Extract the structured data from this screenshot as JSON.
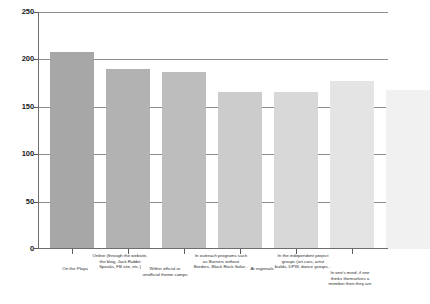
{
  "chart_data": {
    "type": "bar",
    "title": "",
    "subtitle": "",
    "xlabel": "",
    "ylabel": "",
    "ylim": [
      0,
      250
    ],
    "ytick_labels": [
      "0",
      "50",
      "100",
      "150",
      "200",
      "250"
    ],
    "ytick_values": [
      0,
      50,
      100,
      150,
      200,
      250
    ],
    "grid": true,
    "legend": "none",
    "categories": [
      "On the Playa",
      "Online (through the website, the blog, Jack Rabbit Speaks, FB site, etc.)",
      "Within official or unofficial theme camps",
      "In outreach programs such as Burners without Borders, Black Rock Solar...",
      "At regionals",
      "In the independent project groups (art cars, artist builds, DPW, dance groups...",
      "In one's mind, if one thinks themselves a member then they are"
    ],
    "values": [
      208,
      190,
      187,
      166,
      166,
      177,
      168
    ],
    "bar_colors": [
      "#a7a7a7",
      "#b2b2b2",
      "#bdbdbd",
      "#cccccc",
      "#d8d8d8",
      "#e4e4e4",
      "#f1f1f1"
    ]
  },
  "axis": {
    "y_ticks": [
      {
        "label": "250",
        "value": 250
      },
      {
        "label": "200",
        "value": 200
      },
      {
        "label": "150",
        "value": 150
      },
      {
        "label": "100",
        "value": 100
      },
      {
        "label": "50",
        "value": 50
      },
      {
        "label": "0",
        "value": 0
      }
    ]
  },
  "labels": {
    "cat0": "On the Playa",
    "cat1_l1": "Online (through the website,",
    "cat1_l2": "the blog, Jack Rabbit",
    "cat1_l3": "Speaks, FB site, etc.)",
    "cat2_l1": "Within official or",
    "cat2_l2": "unofficial theme camps",
    "cat3_l1": "In outreach programs such",
    "cat3_l2": "as Burners without",
    "cat3_l3": "Borders, Black Rock Solar...",
    "cat4": "At regionals",
    "cat5_l1": "In the independent project",
    "cat5_l2": "groups (art cars, artist",
    "cat5_l3": "builds, DPW, dance groups...",
    "cat6_l1": "In one's mind, if one",
    "cat6_l2": "thinks themselves a",
    "cat6_l3": "member then they are"
  }
}
